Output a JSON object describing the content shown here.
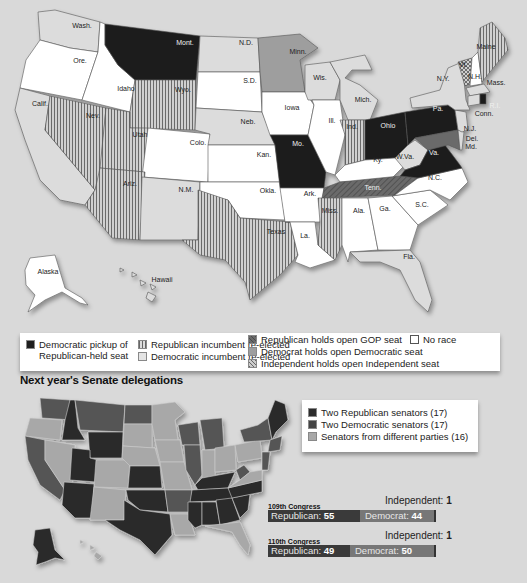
{
  "colors": {
    "background": "#d9d9d9",
    "dem_pickup": "#1e1e1e",
    "rep_incumbent_hatch": "#9a9a9a",
    "dem_incumbent": "#dcdcdc",
    "rep_open_hold": "#5a5a5a",
    "dem_open_hold": "#9e9e9e",
    "no_race": "#ffffff",
    "two_rep": "#2c2c2c",
    "two_dem": "#444444",
    "mixed": "#a8a8a8"
  },
  "election_map": {
    "state_labels": [
      {
        "abbr": "Wash.",
        "x": 82,
        "y": 28,
        "result": "dem_incumbent"
      },
      {
        "abbr": "Ore.",
        "x": 80,
        "y": 63,
        "result": "no_race"
      },
      {
        "abbr": "Calif.",
        "x": 40,
        "y": 106,
        "result": "dem_incumbent"
      },
      {
        "abbr": "Idaho",
        "x": 126,
        "y": 91,
        "result": "no_race"
      },
      {
        "abbr": "Nev.",
        "x": 93,
        "y": 118,
        "result": "rep_incumbent"
      },
      {
        "abbr": "Mont.",
        "x": 185,
        "y": 45,
        "result": "dem_pickup"
      },
      {
        "abbr": "Wyo.",
        "x": 183,
        "y": 92,
        "result": "rep_incumbent"
      },
      {
        "abbr": "Utah",
        "x": 140,
        "y": 137,
        "result": "rep_incumbent"
      },
      {
        "abbr": "Colo.",
        "x": 198,
        "y": 145,
        "result": "no_race"
      },
      {
        "abbr": "Ariz.",
        "x": 130,
        "y": 186,
        "result": "rep_incumbent"
      },
      {
        "abbr": "N.M.",
        "x": 186,
        "y": 192,
        "result": "dem_incumbent"
      },
      {
        "abbr": "N.D.",
        "x": 246,
        "y": 45,
        "result": "dem_incumbent"
      },
      {
        "abbr": "S.D.",
        "x": 250,
        "y": 83,
        "result": "no_race"
      },
      {
        "abbr": "Neb.",
        "x": 248,
        "y": 124,
        "result": "dem_incumbent"
      },
      {
        "abbr": "Kan.",
        "x": 264,
        "y": 157,
        "result": "no_race"
      },
      {
        "abbr": "Okla.",
        "x": 268,
        "y": 193,
        "result": "no_race"
      },
      {
        "abbr": "Texas",
        "x": 276,
        "y": 234,
        "result": "rep_incumbent"
      },
      {
        "abbr": "Minn.",
        "x": 298,
        "y": 54,
        "result": "dem_open"
      },
      {
        "abbr": "Iowa",
        "x": 292,
        "y": 110,
        "result": "no_race"
      },
      {
        "abbr": "Mo.",
        "x": 298,
        "y": 146,
        "result": "dem_pickup"
      },
      {
        "abbr": "Ark.",
        "x": 310,
        "y": 196,
        "result": "no_race"
      },
      {
        "abbr": "La.",
        "x": 305,
        "y": 238,
        "result": "no_race"
      },
      {
        "abbr": "Wis.",
        "x": 320,
        "y": 80,
        "result": "dem_incumbent"
      },
      {
        "abbr": "Ill.",
        "x": 332,
        "y": 123,
        "result": "no_race"
      },
      {
        "abbr": "Mich.",
        "x": 363,
        "y": 102,
        "result": "dem_incumbent"
      },
      {
        "abbr": "Ind.",
        "x": 352,
        "y": 129,
        "result": "rep_incumbent"
      },
      {
        "abbr": "Ohio",
        "x": 388,
        "y": 128,
        "result": "dem_pickup"
      },
      {
        "abbr": "Ky.",
        "x": 378,
        "y": 162,
        "result": "no_race"
      },
      {
        "abbr": "Tenn.",
        "x": 373,
        "y": 190,
        "result": "rep_open"
      },
      {
        "abbr": "Miss.",
        "x": 330,
        "y": 213,
        "result": "rep_incumbent"
      },
      {
        "abbr": "Ala.",
        "x": 359,
        "y": 213,
        "result": "no_race"
      },
      {
        "abbr": "Ga.",
        "x": 385,
        "y": 211,
        "result": "no_race"
      },
      {
        "abbr": "Fla.",
        "x": 409,
        "y": 259,
        "result": "dem_incumbent"
      },
      {
        "abbr": "S.C.",
        "x": 422,
        "y": 207,
        "result": "no_race"
      },
      {
        "abbr": "N.C.",
        "x": 435,
        "y": 180,
        "result": "no_race"
      },
      {
        "abbr": "W.Va.",
        "x": 405,
        "y": 159,
        "result": "dem_incumbent"
      },
      {
        "abbr": "Va.",
        "x": 434,
        "y": 155,
        "result": "dem_pickup"
      },
      {
        "abbr": "Pa.",
        "x": 438,
        "y": 111,
        "result": "dem_pickup"
      },
      {
        "abbr": "N.Y.",
        "x": 443,
        "y": 81,
        "result": "dem_incumbent"
      },
      {
        "abbr": "Vt.",
        "x": 463,
        "y": 67,
        "result": "ind_open"
      },
      {
        "abbr": "N.H.",
        "x": 475,
        "y": 79,
        "result": "no_race"
      },
      {
        "abbr": "Maine",
        "x": 486,
        "y": 49,
        "result": "rep_incumbent"
      },
      {
        "abbr": "Mass.",
        "x": 496,
        "y": 85,
        "result": "dem_incumbent"
      },
      {
        "abbr": "R.I.",
        "x": 495,
        "y": 108,
        "result": "dem_pickup"
      },
      {
        "abbr": "Conn.",
        "x": 484,
        "y": 116,
        "result": "dem_incumbent"
      },
      {
        "abbr": "N.J.",
        "x": 470,
        "y": 131,
        "result": "dem_incumbent"
      },
      {
        "abbr": "Del.",
        "x": 472,
        "y": 141,
        "result": "dem_incumbent"
      },
      {
        "abbr": "Md.",
        "x": 471,
        "y": 149,
        "result": "dem_open"
      },
      {
        "abbr": "Alaska",
        "x": 48,
        "y": 274,
        "result": "no_race"
      },
      {
        "abbr": "Hawaii",
        "x": 162,
        "y": 282,
        "result": "dem_incumbent"
      }
    ]
  },
  "legend": {
    "dem_pickup": "Democratic pickup of",
    "dem_pickup_line2": "Republican-held seat",
    "rep_incumbent": "Republican incumbent re-elected",
    "dem_incumbent": "Democratic incumbent re-elected",
    "rep_open": "Republican holds open GOP seat",
    "dem_open": "Democrat holds open Democratic seat",
    "ind_open": "Independent holds open Independent seat",
    "no_race": "No race"
  },
  "delegations": {
    "title": "Next year's Senate delegations",
    "legend": [
      {
        "label": "Two Republican senators (17)",
        "key": "two_rep"
      },
      {
        "label": "Two Democratic senators (17)",
        "key": "two_dem"
      },
      {
        "label": "Senators from different parties (16)",
        "key": "mixed"
      }
    ]
  },
  "chart_data": {
    "type": "bar",
    "categories": [
      "109th Congress",
      "110th Congress"
    ],
    "series": [
      {
        "name": "Republican",
        "values": [
          55,
          49
        ]
      },
      {
        "name": "Democrat",
        "values": [
          44,
          50
        ]
      },
      {
        "name": "Independent",
        "values": [
          1,
          1
        ]
      }
    ],
    "stacked": true,
    "orientation": "horizontal"
  },
  "congress": [
    {
      "title": "109th Congress",
      "rep_label": "Republican:",
      "rep": "55",
      "dem_label": "Democrat:",
      "dem": "44",
      "ind_label": "Independent:",
      "ind": "1"
    },
    {
      "title": "110th Congress",
      "rep_label": "Republican:",
      "rep": "49",
      "dem_label": "Democrat:",
      "dem": "50",
      "ind_label": "Independent:",
      "ind": "1"
    }
  ]
}
